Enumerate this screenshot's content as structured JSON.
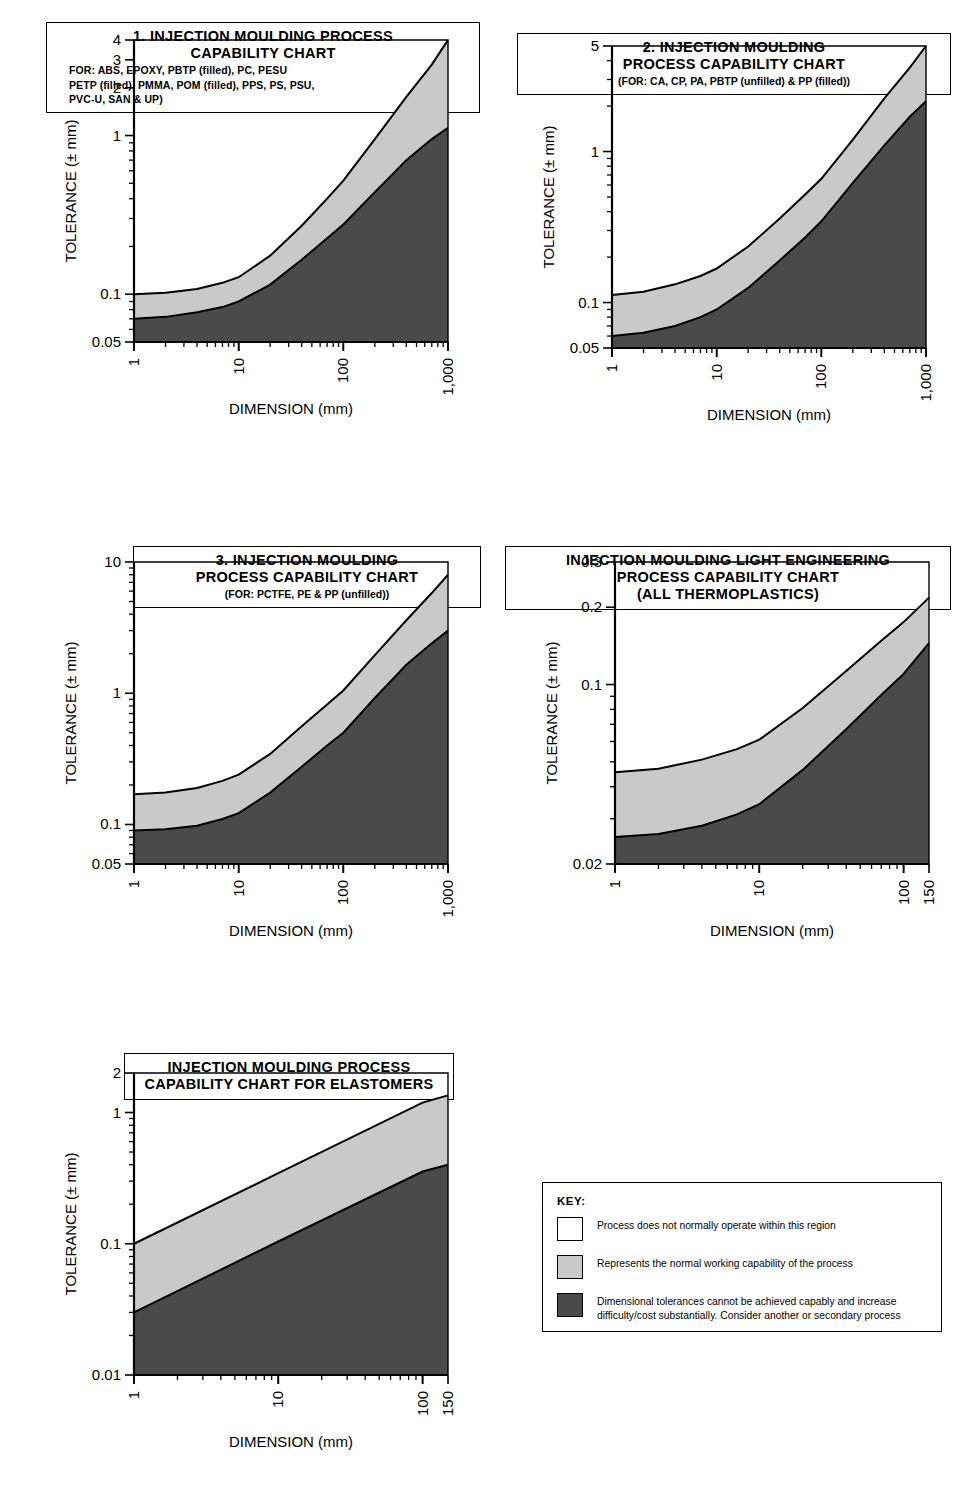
{
  "charts": [
    {
      "id": "chart-1",
      "title_lines": [
        "1. INJECTION MOULDING PROCESS",
        "CAPABILITY CHART"
      ],
      "subtitle_lines": [
        "FOR: ABS, EPOXY, PBTP (filled), PC, PESU",
        "PETP (filled), PMMA, POM (filled), PPS, PS, PSU,",
        "PVC-U, SAN & UP)"
      ],
      "subtitle_align": "left",
      "chart_data": {
        "type": "area",
        "title": "1. INJECTION MOULDING PROCESS CAPABILITY CHART",
        "xlabel": "DIMENSION (mm)",
        "ylabel": "TOLERANCE (± mm)",
        "xscale": "log",
        "yscale": "log",
        "xlim": [
          1,
          1000
        ],
        "ylim": [
          0.05,
          4
        ],
        "xticks": [
          1,
          10,
          100,
          1000
        ],
        "xticklabels": [
          "1",
          "10",
          "100",
          "1,000"
        ],
        "yticks": [
          0.05,
          0.1,
          1,
          2,
          3,
          4
        ],
        "yticklabels": [
          "0.05",
          "0.1",
          "1",
          "2",
          "3",
          "4"
        ],
        "series": [
          {
            "name": "upper boundary",
            "x": [
              1,
              2,
              4,
              7,
              10,
              20,
              40,
              70,
              100,
              200,
              400,
              700,
              1000
            ],
            "values": [
              0.1,
              0.102,
              0.108,
              0.118,
              0.128,
              0.175,
              0.27,
              0.4,
              0.52,
              0.95,
              1.75,
              2.8,
              4.0
            ]
          },
          {
            "name": "lower boundary",
            "x": [
              1,
              2,
              4,
              7,
              10,
              20,
              40,
              70,
              100,
              200,
              400,
              700,
              1000
            ],
            "values": [
              0.07,
              0.072,
              0.077,
              0.083,
              0.09,
              0.115,
              0.165,
              0.225,
              0.275,
              0.44,
              0.7,
              0.95,
              1.12
            ]
          }
        ]
      }
    },
    {
      "id": "chart-2",
      "title_lines": [
        "2.  INJECTION MOULDING",
        "PROCESS CAPABILITY CHART"
      ],
      "subtitle_lines": [
        "(FOR: CA,  CP, PA, PBTP (unfilled)  & PP (filled))"
      ],
      "subtitle_align": "center",
      "chart_data": {
        "type": "area",
        "title": "2. INJECTION MOULDING PROCESS CAPABILITY CHART",
        "xlabel": "DIMENSION (mm)",
        "ylabel": "TOLERANCE (± mm)",
        "xscale": "log",
        "yscale": "log",
        "xlim": [
          1,
          1000
        ],
        "ylim": [
          0.05,
          5
        ],
        "xticks": [
          1,
          10,
          100,
          1000
        ],
        "xticklabels": [
          "1",
          "10",
          "100",
          "1,000"
        ],
        "yticks": [
          0.05,
          0.1,
          1,
          5
        ],
        "yticklabels": [
          "0.05",
          "0.1",
          "1",
          "5"
        ],
        "series": [
          {
            "name": "upper boundary",
            "x": [
              1,
              2,
              4,
              7,
              10,
              20,
              40,
              70,
              100,
              200,
              400,
              700,
              1000
            ],
            "values": [
              0.112,
              0.118,
              0.132,
              0.15,
              0.168,
              0.235,
              0.36,
              0.52,
              0.66,
              1.2,
              2.25,
              3.6,
              5.0
            ]
          },
          {
            "name": "lower boundary",
            "x": [
              1,
              2,
              4,
              7,
              10,
              20,
              40,
              70,
              100,
              200,
              400,
              700,
              1000
            ],
            "values": [
              0.06,
              0.063,
              0.07,
              0.08,
              0.09,
              0.125,
              0.19,
              0.27,
              0.345,
              0.62,
              1.1,
              1.7,
              2.15
            ]
          }
        ]
      }
    },
    {
      "id": "chart-3",
      "title_lines": [
        "3.  INJECTION  MOULDING",
        "PROCESS CAPABILITY CHART"
      ],
      "subtitle_lines": [
        "(FOR: PCTFE, PE & PP (unfilled))"
      ],
      "subtitle_align": "center",
      "chart_data": {
        "type": "area",
        "title": "3. INJECTION MOULDING PROCESS CAPABILITY CHART",
        "xlabel": "DIMENSION (mm)",
        "ylabel": "TOLERANCE (± mm)",
        "xscale": "log",
        "yscale": "log",
        "xlim": [
          1,
          1000
        ],
        "ylim": [
          0.05,
          10
        ],
        "xticks": [
          1,
          10,
          100,
          1000
        ],
        "xticklabels": [
          "1",
          "10",
          "100",
          "1,000"
        ],
        "yticks": [
          0.05,
          0.1,
          1,
          10
        ],
        "yticklabels": [
          "0.05",
          "0.1",
          "1",
          "10"
        ],
        "series": [
          {
            "name": "upper boundary",
            "x": [
              1,
              2,
              4,
              7,
              10,
              20,
              40,
              70,
              100,
              200,
              400,
              700,
              1000
            ],
            "values": [
              0.17,
              0.175,
              0.19,
              0.215,
              0.24,
              0.345,
              0.56,
              0.82,
              1.05,
              1.95,
              3.6,
              5.8,
              8.0
            ]
          },
          {
            "name": "lower boundary",
            "x": [
              1,
              2,
              4,
              7,
              10,
              20,
              40,
              70,
              100,
              200,
              400,
              700,
              1000
            ],
            "values": [
              0.09,
              0.092,
              0.098,
              0.11,
              0.122,
              0.175,
              0.275,
              0.4,
              0.5,
              0.92,
              1.65,
              2.4,
              3.0
            ]
          }
        ]
      }
    },
    {
      "id": "chart-4",
      "title_lines": [
        "INJECTION MOULDING LIGHT ENGINEERING",
        "PROCESS CAPABILITY CHART",
        "(ALL THERMOPLASTICS)"
      ],
      "subtitle_lines": [],
      "subtitle_align": "center",
      "chart_data": {
        "type": "area",
        "title": "INJECTION MOULDING LIGHT ENGINEERING PROCESS CAPABILITY CHART (ALL THERMOPLASTICS)",
        "xlabel": "DIMENSION (mm)",
        "ylabel": "TOLERANCE (± mm)",
        "xscale": "log",
        "yscale": "log",
        "xlim": [
          1,
          150
        ],
        "ylim": [
          0.02,
          0.3
        ],
        "xticks": [
          1,
          10,
          100,
          150
        ],
        "xticklabels": [
          "1",
          "10",
          "100",
          "150"
        ],
        "yticks": [
          0.02,
          0.1,
          0.2,
          0.3
        ],
        "yticklabels": [
          "0.02",
          "0.1",
          "0.2",
          "0.3"
        ],
        "series": [
          {
            "name": "upper boundary",
            "x": [
              1,
              2,
              4,
              7,
              10,
              20,
              40,
              70,
              100,
              150
            ],
            "values": [
              0.0455,
              0.047,
              0.051,
              0.056,
              0.061,
              0.081,
              0.113,
              0.148,
              0.175,
              0.218
            ]
          },
          {
            "name": "lower boundary",
            "x": [
              1,
              2,
              4,
              7,
              10,
              20,
              40,
              70,
              100,
              150
            ],
            "values": [
              0.0255,
              0.0262,
              0.0282,
              0.0312,
              0.0342,
              0.0465,
              0.067,
              0.091,
              0.11,
              0.145
            ]
          }
        ]
      }
    },
    {
      "id": "chart-5",
      "title_lines": [
        "INJECTION MOULDING PROCESS",
        "CAPABILITY CHART FOR ELASTOMERS"
      ],
      "subtitle_lines": [],
      "subtitle_align": "center",
      "chart_data": {
        "type": "area",
        "title": "INJECTION MOULDING PROCESS CAPABILITY CHART FOR ELASTOMERS",
        "xlabel": "DIMENSION (mm)",
        "ylabel": "TOLERANCE (± mm)",
        "xscale": "log",
        "yscale": "log",
        "xlim": [
          1,
          150
        ],
        "ylim": [
          0.01,
          2
        ],
        "xticks": [
          1,
          10,
          100,
          150
        ],
        "xticklabels": [
          "1",
          "10",
          "100",
          "150"
        ],
        "yticks": [
          0.01,
          0.1,
          1,
          2
        ],
        "yticklabels": [
          "0.01",
          "0.1",
          "1",
          "2"
        ],
        "series": [
          {
            "name": "upper boundary",
            "x": [
              1,
              10,
              100,
              150
            ],
            "values": [
              0.1,
              0.345,
              1.19,
              1.35
            ]
          },
          {
            "name": "lower boundary",
            "x": [
              1,
              10,
              100,
              150
            ],
            "values": [
              0.03,
              0.104,
              0.355,
              0.4
            ]
          }
        ]
      }
    }
  ],
  "key": {
    "heading": "KEY:",
    "items": [
      {
        "swatch": "white",
        "text": "Process does not normally operate within this region"
      },
      {
        "swatch": "light-gray",
        "text": "Represents the normal working capability of the process"
      },
      {
        "swatch": "dark-gray",
        "text": "Dimensional tolerances cannot be achieved capably and increase difficulty/cost substantially. Consider another or secondary process"
      }
    ]
  },
  "colors": {
    "white_region": "#ffffff",
    "light_gray_region": "#c9c9c9",
    "dark_gray_region": "#4a4a4a",
    "line": "#000000"
  }
}
